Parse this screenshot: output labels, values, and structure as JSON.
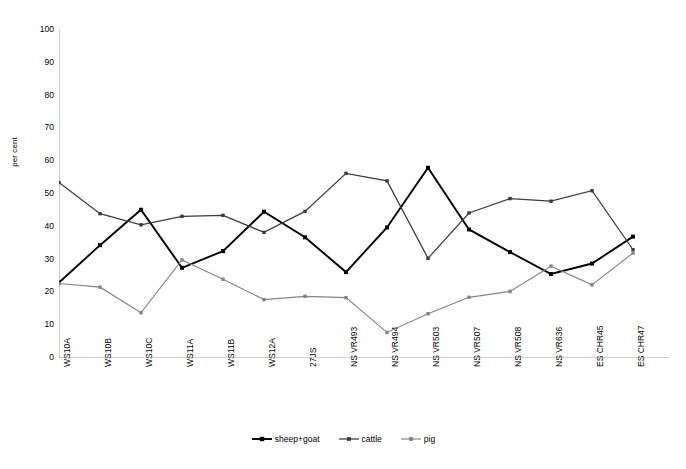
{
  "chart_data": {
    "type": "line",
    "title": "",
    "xlabel": "",
    "ylabel": "per cent",
    "ylim": [
      0,
      100
    ],
    "ytick_step": 10,
    "yticks": [
      100,
      90,
      80,
      70,
      60,
      50,
      40,
      30,
      20,
      10,
      0
    ],
    "grid": false,
    "legend_position": "bottom-center",
    "categories": [
      "WS10A",
      "WS10B",
      "WS10C",
      "WS11A",
      "WS11B",
      "WS12A",
      "27JS",
      "NS VR493",
      "NS VR494",
      "NS VR503",
      "NS VR507",
      "NS VR508",
      "NS VR636",
      "ES CHR45",
      "ES CHR47"
    ],
    "series": [
      {
        "name": "sheep+goat",
        "color": "#000000",
        "marker": "square",
        "values": [
          23.0,
          34.4,
          45.2,
          27.5,
          32.6,
          44.6,
          36.8,
          26.2,
          39.8,
          58.0,
          39.2,
          32.3,
          25.6,
          28.8,
          37.0
        ]
      },
      {
        "name": "cattle",
        "color": "#3b3b3b",
        "marker": "square",
        "values": [
          53.5,
          44.0,
          40.6,
          43.2,
          43.5,
          38.3,
          44.7,
          56.3,
          54.0,
          30.4,
          44.2,
          48.6,
          47.8,
          51.0,
          33.0
        ]
      },
      {
        "name": "pig",
        "color": "#848484",
        "marker": "square",
        "values": [
          22.7,
          21.6,
          13.8,
          29.9,
          24.0,
          17.8,
          18.8,
          18.4,
          7.8,
          13.5,
          18.5,
          20.3,
          28.0,
          22.3,
          32.0
        ]
      }
    ]
  },
  "legend": {
    "items": [
      {
        "label": "sheep+goat"
      },
      {
        "label": "cattle"
      },
      {
        "label": "pig"
      }
    ]
  },
  "axis": {
    "y_title": "per cent"
  }
}
